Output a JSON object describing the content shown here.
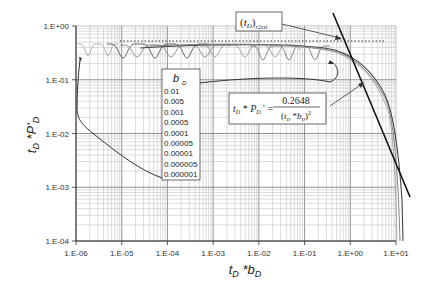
{
  "chart_data": {
    "type": "line",
    "title": "",
    "xlabel": "tD*bD",
    "ylabel": "tD*P'D",
    "xscale": "log",
    "yscale": "log",
    "xlim": [
      1e-06,
      10
    ],
    "ylim": [
      0.0001,
      1
    ],
    "grid": true,
    "x_ticks": [
      "1.E-06",
      "1.E-05",
      "1.E-04",
      "1.E-03",
      "1.E-02",
      "1.E-01",
      "1.E+00",
      "1.E+01"
    ],
    "y_ticks": [
      "1.E+00",
      "1.E-01",
      "1.E-02",
      "1.E-03",
      "1.E-04"
    ],
    "legend": {
      "title": "b_D",
      "entries": [
        "0.01",
        "0.005",
        "0.001",
        "0.0005",
        "0.0001",
        "0.00005",
        "0.00001",
        "0.000005",
        "0.000001"
      ]
    },
    "annotations": [
      {
        "text": "(t_D)_r2ssi",
        "points_to": [
          1.2,
          0.5
        ]
      },
      {
        "text": "t_D * P_D ' = 0.2648 / (t_D * b_D)^2",
        "points_to": [
          1.7,
          0.1
        ]
      }
    ],
    "series": [
      {
        "name": "radial flow plateau (dotted)",
        "style": "dotted",
        "points": [
          [
            1e-05,
            0.5
          ],
          [
            3,
            0.5
          ]
        ]
      },
      {
        "name": "steady-state asymptote",
        "style": "solid-bold",
        "points": [
          [
            1.2,
            1.15
          ],
          [
            9,
            0.0043
          ]
        ]
      },
      {
        "name": "type curves (oscillating, converge ~0.5 then decline)",
        "points": [
          [
            1e-06,
            0.45
          ],
          [
            0.0001,
            0.45
          ],
          [
            0.01,
            0.47
          ],
          [
            0.1,
            0.45
          ],
          [
            0.5,
            0.38
          ],
          [
            1,
            0.25
          ],
          [
            2,
            0.1
          ],
          [
            4,
            0.01
          ],
          [
            6,
            0.0001
          ]
        ]
      }
    ]
  },
  "labels": {
    "x_axis": "t",
    "x_sub1": "D",
    "x_mid": " *b",
    "x_sub2": "D",
    "y_axis_text": "t*P'"
  }
}
